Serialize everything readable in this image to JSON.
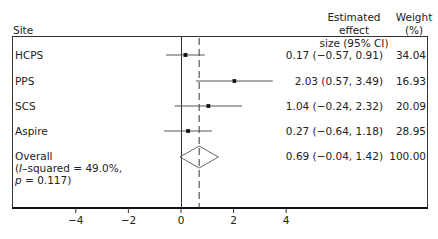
{
  "chart_data": {
    "type": "forest",
    "title": "",
    "columns": {
      "site_header": "Site",
      "effect_header_line1": "Estimated effect",
      "effect_header_line2": "size (95% CI)",
      "weight_header_line1": "Weight",
      "weight_header_line2": "(%)"
    },
    "studies": [
      {
        "site": "HCPS",
        "estimate": 0.17,
        "lower": -0.57,
        "upper": 0.91,
        "weight": 34.04,
        "est_text": "0.17 (−0.57, 0.91)",
        "weight_text": "34.04"
      },
      {
        "site": "PPS",
        "estimate": 2.03,
        "lower": 0.57,
        "upper": 3.49,
        "weight": 16.93,
        "est_text": "2.03 (0.57, 3.49)",
        "weight_text": "16.93"
      },
      {
        "site": "SCS",
        "estimate": 1.04,
        "lower": -0.24,
        "upper": 2.32,
        "weight": 20.09,
        "est_text": "1.04 (−0.24, 2.32)",
        "weight_text": "20.09"
      },
      {
        "site": "Aspire",
        "estimate": 0.27,
        "lower": -0.64,
        "upper": 1.18,
        "weight": 28.95,
        "est_text": "0.27 (−0.64, 1.18)",
        "weight_text": "28.95"
      }
    ],
    "overall": {
      "label_line1": "Overall",
      "label_line2_prefix": "(",
      "label_line2_italic": "I",
      "label_line2_rest": "–squared = 49.0%,",
      "label_line3_italic": "p",
      "label_line3_rest": " = 0.117)",
      "i_squared": 49.0,
      "p_value": 0.117,
      "estimate": 0.69,
      "lower": -0.04,
      "upper": 1.42,
      "weight": 100.0,
      "est_text": "0.69 (−0.04, 1.42)",
      "weight_text": "100.00"
    },
    "x_axis": {
      "ticks": [
        -4,
        -2,
        0,
        2,
        4
      ],
      "tick_labels": [
        "−4",
        "−2",
        "0",
        "2",
        "4"
      ],
      "xlabel": "",
      "null_line": 0,
      "overall_line": 0.69
    },
    "ylabel": "",
    "grid": false,
    "legend": null
  }
}
